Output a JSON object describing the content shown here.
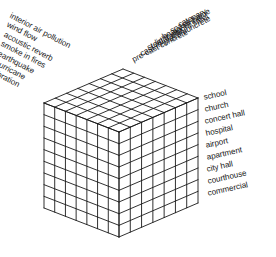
{
  "diagram": {
    "type": "isometric-cube-matrix",
    "grid": {
      "top_face_rows": 7,
      "top_face_cols": 7,
      "front_left_cols": 7,
      "front_left_rows": 9,
      "front_right_cols": 7,
      "front_right_rows": 9
    },
    "colors": {
      "line": "#1a1a1a",
      "background": "#ffffff",
      "text": "#171717"
    },
    "axes": {
      "left_axis": {
        "name": "performance-criteria",
        "items": [
          "interior air pollution",
          "wind flow",
          "acoustic reverb",
          "smoke in fires",
          "earthquake",
          "hurricane",
          "vibration"
        ]
      },
      "right_top_axis": {
        "name": "structural-systems",
        "items": [
          "pre-cast concrete",
          "cast-in-place concrete",
          "steel frame",
          "light weight steel",
          "heavy timber",
          "space frame",
          "catenary"
        ]
      },
      "right_side_axis": {
        "name": "building-types",
        "items": [
          "school",
          "church",
          "concert hall",
          "hospital",
          "airport",
          "apartment",
          "city hall",
          "courthouse",
          "commercial"
        ]
      }
    }
  }
}
